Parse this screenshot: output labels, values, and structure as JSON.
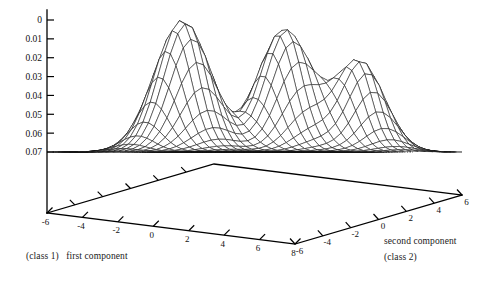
{
  "figure": {
    "title": "",
    "kind": "3d-surface-wireframe-with-contours"
  },
  "axes": {
    "vertical": {
      "name": "density",
      "ticks": [
        "0.07",
        "0.06",
        "0.05",
        "0.04",
        "0.03",
        "0.02",
        "0.01",
        "0"
      ],
      "values": [
        0.07,
        0.06,
        0.05,
        0.04,
        0.03,
        0.02,
        0.01,
        0
      ]
    },
    "x": {
      "label_line1": "(class 1)",
      "label_line2": "first component",
      "ticks": [
        "-6",
        "-4",
        "-2",
        "0",
        "2",
        "4",
        "6",
        "8"
      ],
      "values": [
        -6,
        -4,
        -2,
        0,
        2,
        4,
        6,
        8
      ]
    },
    "y": {
      "label_line1": "second component",
      "label_line2": "(class 2)",
      "ticks": [
        "-6",
        "-4",
        "-2",
        "0",
        "2",
        "4",
        "6"
      ],
      "values": [
        -6,
        -4,
        -2,
        0,
        2,
        4,
        6
      ]
    }
  },
  "chart_data": {
    "type": "surface",
    "title": "",
    "xlabel": "first component (class 1)",
    "ylabel": "second component (class 2)",
    "zlabel": "",
    "xlim": [
      -6,
      8
    ],
    "ylim": [
      -6,
      6
    ],
    "zlim": [
      0,
      0.075
    ],
    "grid": false,
    "legend": null,
    "ztick_values": [
      0,
      0.01,
      0.02,
      0.03,
      0.04,
      0.05,
      0.06,
      0.07
    ],
    "xtick_values": [
      -6,
      -4,
      -2,
      0,
      2,
      4,
      6,
      8
    ],
    "ytick_values": [
      -6,
      -4,
      -2,
      0,
      2,
      4,
      6
    ],
    "components": [
      {
        "name": "mode-1",
        "mean_x": -2.2,
        "mean_y": -1.1,
        "sigma_x": 1.25,
        "sigma_y": 1.25,
        "peak_z": 0.07
      },
      {
        "name": "mode-2",
        "mean_x": 2.2,
        "mean_y": 0.6,
        "sigma_x": 1.2,
        "sigma_y": 1.2,
        "peak_z": 0.065
      },
      {
        "name": "mode-3",
        "mean_x": 4.9,
        "mean_y": 2.6,
        "sigma_x": 1.1,
        "sigma_y": 1.1,
        "peak_z": 0.048
      }
    ],
    "mesh": {
      "nx": 34,
      "ny": 30,
      "style": "wireframe",
      "hidden_line_removal": true
    },
    "contours": {
      "levels": 9,
      "linestyle": "dashed",
      "projected_on": "base-plane"
    }
  }
}
